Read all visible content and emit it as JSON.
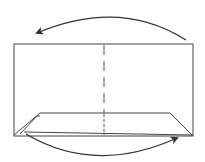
{
  "diagram": {
    "type": "folding-instruction",
    "colors": {
      "stroke": "#333333",
      "background": "#ffffff"
    },
    "elements": {
      "paper": "rectangle",
      "center_crease": "dashed-vertical-line",
      "bottom_flap": "folded-trapezoid",
      "top_arrow": "fold-right-to-left",
      "bottom_arrow": "fold-left-to-right"
    }
  }
}
